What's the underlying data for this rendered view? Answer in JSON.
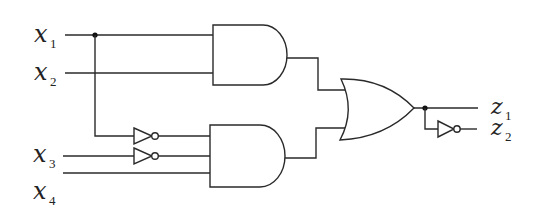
{
  "diagram": {
    "type": "logic-circuit",
    "inputs": [
      {
        "id": "x1",
        "var": "x",
        "sub": "1"
      },
      {
        "id": "x2",
        "var": "x",
        "sub": "2"
      },
      {
        "id": "x3",
        "var": "x",
        "sub": "3"
      },
      {
        "id": "x4",
        "var": "x",
        "sub": "4"
      }
    ],
    "outputs": [
      {
        "id": "z1",
        "var": "z",
        "sub": "1"
      },
      {
        "id": "z2",
        "var": "z",
        "sub": "2"
      }
    ],
    "gates": [
      {
        "id": "and1",
        "type": "AND",
        "inputs": [
          "x1",
          "x2"
        ]
      },
      {
        "id": "not1",
        "type": "NOT",
        "inputs": [
          "x1"
        ]
      },
      {
        "id": "not2",
        "type": "NOT",
        "inputs": [
          "x3"
        ]
      },
      {
        "id": "and2",
        "type": "AND",
        "inputs": [
          "not1",
          "not2",
          "x4"
        ]
      },
      {
        "id": "or1",
        "type": "OR",
        "inputs": [
          "and1",
          "and2"
        ],
        "output": "z1"
      },
      {
        "id": "not3",
        "type": "NOT",
        "inputs": [
          "or1"
        ],
        "output": "z2"
      }
    ],
    "colors": {
      "line": "#2a2a2a",
      "background": "#ffffff"
    }
  }
}
